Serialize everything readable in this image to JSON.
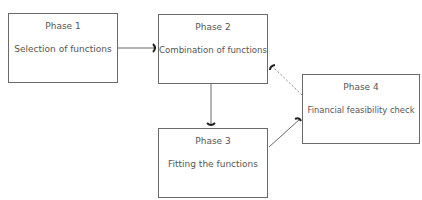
{
  "diagram": {
    "nodes": [
      {
        "id": "phase1",
        "title": "Phase 1",
        "label": "Selection of functions"
      },
      {
        "id": "phase2",
        "title": "Phase 2",
        "label": "Combination of functions"
      },
      {
        "id": "phase3",
        "title": "Phase 3",
        "label": "Fitting the functions"
      },
      {
        "id": "phase4",
        "title": "Phase 4",
        "label": "Financial feasibility check"
      }
    ],
    "edges": [
      {
        "from": "phase1",
        "to": "phase2",
        "style": "solid"
      },
      {
        "from": "phase2",
        "to": "phase3",
        "style": "solid"
      },
      {
        "from": "phase3",
        "to": "phase4",
        "style": "solid"
      },
      {
        "from": "phase4",
        "to": "phase2",
        "style": "dashed"
      }
    ],
    "colors": {
      "line": "#6a6a6a",
      "text": "#555555",
      "arrowhead": "#222222"
    }
  }
}
